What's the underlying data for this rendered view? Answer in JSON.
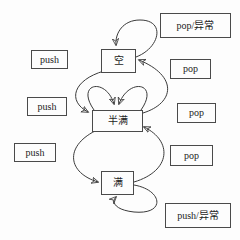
{
  "figure": {
    "type": "state-diagram",
    "background": "#fdfdfd",
    "stroke_color": "#3a3a3a",
    "states": [
      {
        "id": "empty",
        "label": "空"
      },
      {
        "id": "half_full",
        "label": "半满"
      },
      {
        "id": "full",
        "label": "满"
      }
    ],
    "labels": [
      {
        "id": "pop-exception",
        "text": "pop/异常"
      },
      {
        "id": "push-top",
        "text": "push"
      },
      {
        "id": "pop-top",
        "text": "pop"
      },
      {
        "id": "push-middle",
        "text": "push"
      },
      {
        "id": "pop-middle",
        "text": "pop"
      },
      {
        "id": "push-bottom",
        "text": "push"
      },
      {
        "id": "pop-bottom",
        "text": "pop"
      },
      {
        "id": "push-exception",
        "text": "push/异常"
      }
    ],
    "edges": [
      {
        "id": "empty-self-loop",
        "from": "empty",
        "to": "empty"
      },
      {
        "id": "empty-to-half",
        "from": "empty",
        "to": "half_full"
      },
      {
        "id": "half-to-empty",
        "from": "half_full",
        "to": "empty"
      },
      {
        "id": "half-self-loop-left",
        "from": "half_full",
        "to": "half_full"
      },
      {
        "id": "half-self-loop-right",
        "from": "half_full",
        "to": "half_full"
      },
      {
        "id": "half-to-full",
        "from": "half_full",
        "to": "full"
      },
      {
        "id": "full-to-half",
        "from": "full",
        "to": "half_full"
      },
      {
        "id": "full-self-loop",
        "from": "full",
        "to": "full"
      }
    ]
  }
}
